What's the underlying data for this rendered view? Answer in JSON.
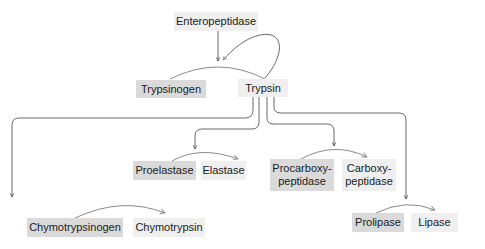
{
  "diagram": {
    "activator": "Enteropeptidase",
    "trypsinogen": "Trypsinogen",
    "trypsin": "Trypsin",
    "pairs": [
      {
        "zymogen": "Chymotrypsinogen",
        "enzyme": "Chymotrypsin"
      },
      {
        "zymogen": "Proelastase",
        "enzyme": "Elastase"
      },
      {
        "zymogen": "Procarboxy-\npeptidase",
        "enzyme": "Carboxy-\npeptidase"
      },
      {
        "zymogen": "Prolipase",
        "enzyme": "Lipase"
      }
    ],
    "colors": {
      "zymogen_box": "#dadada",
      "enzyme_box": "#efefef",
      "line": "#555555",
      "arc": "#8a8a8a"
    }
  }
}
